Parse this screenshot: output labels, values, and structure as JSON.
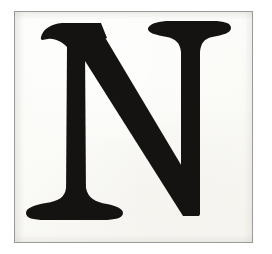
{
  "image": {
    "kind": "letter-specimen-scan",
    "subject_character": "N",
    "subject_description": "Capital letter N, old-style serif typeface, black ink on aged off-white paper",
    "case": "uppercase",
    "script": "Latin",
    "width_px": 272,
    "height_px": 254
  },
  "frame": {
    "border_color": "#9a9a9a",
    "border_width_px": 1,
    "left_px": 14,
    "top_px": 11,
    "width_px": 239,
    "height_px": 232,
    "outer_margin_color": "#ffffff"
  },
  "paper": {
    "base_color": "#fdfdfb",
    "tone_warm": "#f7f6f2",
    "texture": "fine scan grain"
  },
  "glyph": {
    "character": "N",
    "ink_color": "#151312",
    "style": "serif",
    "stroke_contrast": "high",
    "features": [
      "thin vertical left stem",
      "thin vertical right stem",
      "thick descending diagonal",
      "flared top-left serif",
      "wide bracketed bottom-left foot serif",
      "wide top-right serif",
      "pointed bottom-right junction"
    ],
    "bounds": {
      "left_px": 40,
      "top_px": 40,
      "right_px": 222,
      "bottom_px": 212
    },
    "outline_path": "M 40 18 C 44 10, 52 5, 62 4 L 126 4 L 232 148 L 232 42 C 232 30, 226 24, 214 22 C 205 20, 198 18, 196 14 C 195 9, 200 4, 208 4 L 276 4 C 285 4, 290 9, 288 14 C 286 19, 279 21, 270 23 C 258 26, 253 32, 253 44 L 253 236 L 236 236 L 104 58 L 104 196 C 104 210, 110 217, 124 220 C 140 223, 150 227, 151 233 C 152 240, 145 244, 134 244 L 46 244 C 35 244, 28 240, 29 233 C 30 227, 40 223, 56 220 C 70 217, 76 210, 76 196 L 76 40 C 76 28, 70 21, 57 19 C 47 17, 40 24, 40 18 Z"
  }
}
